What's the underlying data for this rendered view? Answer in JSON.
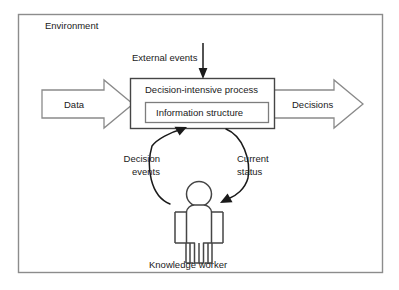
{
  "diagram": {
    "title_label": "Environment",
    "frame": {
      "name": "environment-frame",
      "stroke": "#8c8c8c"
    },
    "nodes": {
      "process": {
        "label": "Decision-intensive process",
        "stroke": "#3d3d3d"
      },
      "information_structure": {
        "label": "Information structure",
        "stroke": "#7a7a7a"
      },
      "actor": {
        "label": "Knowledge worker",
        "stroke": "#3d3d3d"
      }
    },
    "flows": {
      "data_in": {
        "label": "Data",
        "shape": "block-arrow-right",
        "stroke": "#7a7a7a"
      },
      "decisions_out": {
        "label": "Decisions",
        "shape": "block-arrow-right",
        "stroke": "#7a7a7a"
      },
      "external_events": {
        "label": "External events",
        "shape": "arrow-down",
        "stroke": "#1a1a1a"
      },
      "decision_events": {
        "label": "Decision\nevents",
        "label_line1": "Decision",
        "label_line2": "events",
        "shape": "curved-arrow-up",
        "stroke": "#1a1a1a"
      },
      "current_status": {
        "label": "Current\nstatus",
        "label_line1": "Current",
        "label_line2": "status",
        "shape": "curved-arrow-down",
        "stroke": "#1a1a1a"
      }
    },
    "colors": {
      "background": "#ffffff",
      "text": "#1a1a1a",
      "frame_stroke": "#8c8c8c",
      "dark_stroke": "#3d3d3d",
      "mid_stroke": "#7a7a7a"
    }
  }
}
